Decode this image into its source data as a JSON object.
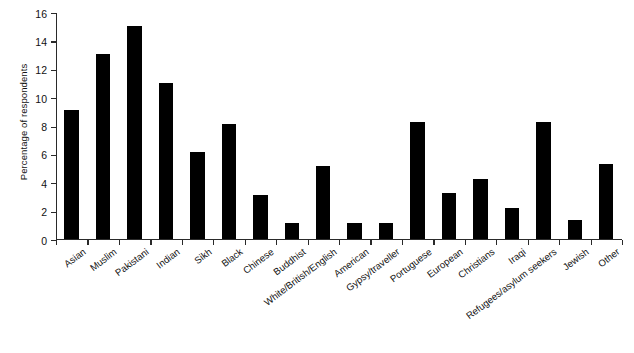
{
  "chart_data": {
    "type": "bar",
    "title": "",
    "xlabel": "",
    "ylabel": "Percentage of respondents",
    "ylim": [
      0,
      16
    ],
    "yticks": [
      0,
      2,
      4,
      6,
      8,
      10,
      12,
      14,
      16
    ],
    "ytick_labels": [
      "0",
      "2",
      "4",
      "6",
      "8",
      "10",
      "12",
      "14",
      "16"
    ],
    "grid": false,
    "legend": null,
    "bar_color": "#000000",
    "axis_color": "#2a2a2a",
    "categories": [
      "Asian",
      "Muslim",
      "Pakistani",
      "Indian",
      "Sikh",
      "Black",
      "Chinese",
      "Buddhist",
      "White/British/English",
      "American",
      "Gypsy/traveller",
      "Portuguese",
      "European",
      "Christians",
      "Iraqi",
      "Refugees/asylum seekers",
      "Jewish",
      "Other"
    ],
    "values": [
      9.1,
      13.0,
      15.0,
      11.0,
      6.1,
      8.1,
      3.1,
      1.1,
      5.1,
      1.1,
      1.1,
      8.2,
      3.2,
      4.2,
      2.2,
      8.2,
      1.3,
      5.3
    ]
  }
}
